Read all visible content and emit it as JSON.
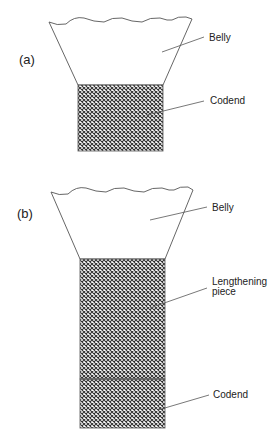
{
  "figure": {
    "panel_a": {
      "label": "(a)",
      "belly_label": "Belly",
      "codend_label": "Codend"
    },
    "panel_b": {
      "label": "(b)",
      "belly_label": "Belly",
      "lengthening_label_lines": [
        "Lengthening",
        "piece"
      ],
      "codend_label": "Codend"
    }
  },
  "colors": {
    "line": "#555555",
    "mesh": "#333333",
    "text": "#222222",
    "background": "#ffffff"
  }
}
